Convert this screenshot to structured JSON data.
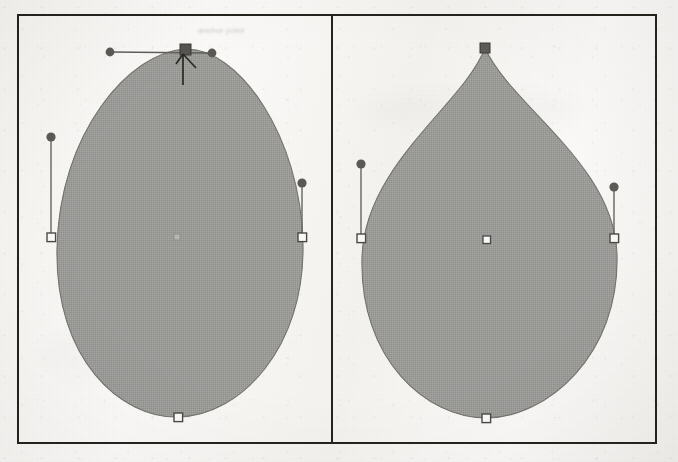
{
  "figure": {
    "background_color": "#f7f5f2",
    "frame_color": "#26241f",
    "shape_fill_color": "#9b9b99",
    "shape_stroke_color": "#6d6b66",
    "handle_color": "#5f5f5c",
    "anchor_fill_color": "#fbfaf8",
    "selected_anchor_color": "#565550"
  },
  "panels": [
    {
      "id": "left",
      "name": "smooth-point-panel",
      "shape_name": "egg-shape-path",
      "top_anchor": {
        "name": "top-anchor-point",
        "type": "smooth",
        "state": "selected",
        "x": 185,
        "y": 49,
        "marker": "filled-square"
      },
      "handles": [
        {
          "name": "top-left-control-handle",
          "from_x": 185,
          "from_y": 49,
          "to_x": 110,
          "to_y": 52,
          "dot": "filled-circle"
        },
        {
          "name": "top-right-control-handle",
          "from_x": 185,
          "from_y": 49,
          "to_x": 212,
          "to_y": 53,
          "dot": "filled-circle"
        }
      ],
      "anchors": [
        {
          "name": "left-side-anchor",
          "x": 51,
          "y": 237,
          "marker": "hollow-square"
        },
        {
          "name": "right-side-anchor",
          "x": 302,
          "y": 237,
          "marker": "hollow-square"
        },
        {
          "name": "bottom-anchor",
          "x": 178,
          "y": 417,
          "marker": "hollow-square"
        }
      ],
      "side_handles": [
        {
          "name": "left-side-control-handle",
          "from_x": 51,
          "from_y": 237,
          "to_x": 51,
          "to_y": 137,
          "dot": "filled-circle"
        },
        {
          "name": "right-side-control-handle",
          "from_x": 302,
          "from_y": 237,
          "to_x": 302,
          "to_y": 183,
          "dot": "filled-circle"
        }
      ],
      "center_marker": {
        "name": "shape-center-marker",
        "x": 177,
        "y": 238,
        "marker": "small-square"
      }
    },
    {
      "id": "right",
      "name": "corner-point-panel",
      "shape_name": "teardrop-shape-path",
      "top_anchor": {
        "name": "top-anchor-point",
        "type": "corner",
        "state": "selected",
        "x": 484,
        "y": 48,
        "marker": "filled-square"
      },
      "handles": [],
      "anchors": [
        {
          "name": "left-side-anchor",
          "x": 361,
          "y": 238,
          "marker": "hollow-square"
        },
        {
          "name": "right-side-anchor",
          "x": 614,
          "y": 238,
          "marker": "hollow-square"
        },
        {
          "name": "bottom-anchor",
          "x": 485,
          "y": 418,
          "marker": "hollow-square"
        }
      ],
      "side_handles": [
        {
          "name": "left-side-control-handle",
          "from_x": 361,
          "from_y": 238,
          "to_x": 361,
          "to_y": 164,
          "dot": "filled-circle"
        },
        {
          "name": "right-side-control-handle",
          "from_x": 614,
          "from_y": 238,
          "to_x": 614,
          "to_y": 187,
          "dot": "filled-circle"
        }
      ],
      "center_marker": {
        "name": "shape-center-marker",
        "x": 486,
        "y": 240,
        "marker": "hollow-square"
      }
    }
  ],
  "tooltip": {
    "name": "anchor-tooltip",
    "text": "anchor point",
    "legible": false
  },
  "cursor": {
    "name": "mouse-cursor",
    "type": "arrow-pointer",
    "x": 186,
    "y": 52
  }
}
